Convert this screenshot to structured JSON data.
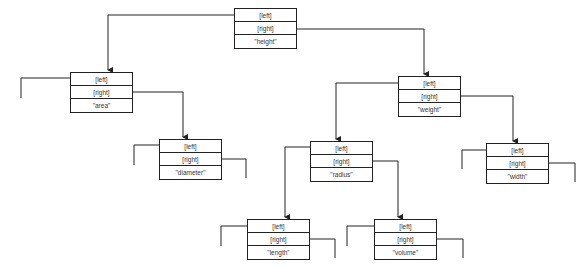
{
  "diagram": {
    "type": "binary-search-tree",
    "field_labels": {
      "left": "[left]",
      "right": "[right]"
    },
    "nodes": [
      {
        "id": "height",
        "value": "\"height\""
      },
      {
        "id": "area",
        "value": "\"area\""
      },
      {
        "id": "diameter",
        "value": "\"diameter\""
      },
      {
        "id": "weight",
        "value": "\"weight\""
      },
      {
        "id": "radius",
        "value": "\"radius\""
      },
      {
        "id": "width",
        "value": "\"width\""
      },
      {
        "id": "length",
        "value": "\"length\""
      },
      {
        "id": "volume",
        "value": "\"volume\""
      }
    ],
    "edges": [
      {
        "from": "height",
        "side": "left",
        "to": "area"
      },
      {
        "from": "height",
        "side": "right",
        "to": "weight"
      },
      {
        "from": "area",
        "side": "left",
        "to": null
      },
      {
        "from": "area",
        "side": "right",
        "to": "diameter"
      },
      {
        "from": "diameter",
        "side": "left",
        "to": null
      },
      {
        "from": "diameter",
        "side": "right",
        "to": null
      },
      {
        "from": "weight",
        "side": "left",
        "to": "radius"
      },
      {
        "from": "weight",
        "side": "right",
        "to": "width"
      },
      {
        "from": "radius",
        "side": "left",
        "to": "length"
      },
      {
        "from": "radius",
        "side": "right",
        "to": "volume"
      },
      {
        "from": "width",
        "side": "left",
        "to": null
      },
      {
        "from": "width",
        "side": "right",
        "to": null
      },
      {
        "from": "length",
        "side": "left",
        "to": null
      },
      {
        "from": "length",
        "side": "right",
        "to": null
      },
      {
        "from": "volume",
        "side": "left",
        "to": null
      },
      {
        "from": "volume",
        "side": "right",
        "to": null
      }
    ],
    "colors": {
      "line": "#222222",
      "text": "#333333",
      "background": "#ffffff"
    }
  }
}
